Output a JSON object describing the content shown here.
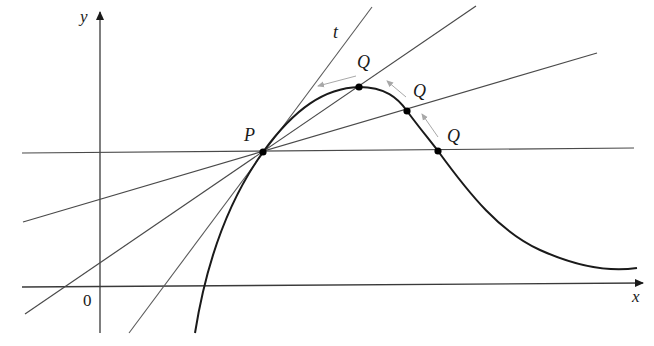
{
  "diagram": {
    "type": "secant-to-tangent illustration",
    "labels": {
      "x_axis": "x",
      "y_axis": "y",
      "origin": "0",
      "point_p": "P",
      "point_q": "Q",
      "tangent": "t"
    },
    "colors": {
      "curve": "#1a1a1a",
      "lines": "#4a4a4a",
      "axes": "#3a3a3a",
      "arrows": "#a8a8a8",
      "points": "#000000"
    },
    "points": {
      "P": [
        263,
        152
      ],
      "Q_positions": [
        [
          438,
          151
        ],
        [
          407,
          111
        ],
        [
          359,
          87
        ]
      ]
    },
    "secant_lines": [
      {
        "name": "secant-1",
        "from": [
          22,
          153
        ],
        "to": [
          634,
          148
        ]
      },
      {
        "name": "secant-2",
        "from": [
          23,
          222
        ],
        "to": [
          597,
          53
        ]
      },
      {
        "name": "secant-3",
        "from": [
          25,
          314
        ],
        "to": [
          476,
          6
        ]
      }
    ],
    "tangent_line": {
      "from": [
        129,
        333
      ],
      "to": [
        372,
        7
      ]
    }
  }
}
